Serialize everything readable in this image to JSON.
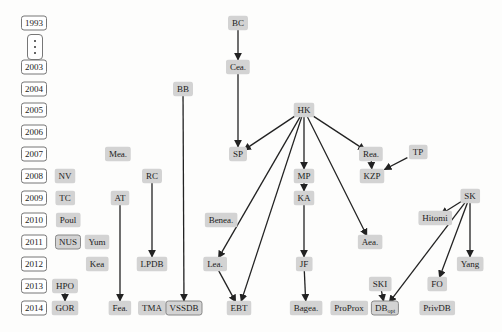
{
  "diagram": {
    "type": "timeline-dependency-graph",
    "years": [
      "1993",
      "2003",
      "2004",
      "2005",
      "2006",
      "2007",
      "2008",
      "2009",
      "2010",
      "2011",
      "2012",
      "2013",
      "2014"
    ],
    "year_gap_marker": "⋮",
    "nodes": [
      {
        "id": "BC",
        "label": "BC",
        "year": "1993",
        "x": 238,
        "y": 23
      },
      {
        "id": "Cea",
        "label": "Cea.",
        "year": "2003",
        "x": 238,
        "y": 67
      },
      {
        "id": "BB",
        "label": "BB",
        "year": "2004",
        "x": 183,
        "y": 89
      },
      {
        "id": "HK",
        "label": "HK",
        "year": "2005",
        "x": 304,
        "y": 110
      },
      {
        "id": "Mea",
        "label": "Mea.",
        "year": "2007",
        "x": 118,
        "y": 154
      },
      {
        "id": "SP",
        "label": "SP",
        "year": "2007",
        "x": 238,
        "y": 154
      },
      {
        "id": "Rea",
        "label": "Rea.",
        "year": "2007",
        "x": 371,
        "y": 154
      },
      {
        "id": "TP",
        "label": "TP",
        "year": "2007",
        "x": 418,
        "y": 152
      },
      {
        "id": "NV",
        "label": "NV",
        "year": "2008",
        "x": 65,
        "y": 176
      },
      {
        "id": "RC",
        "label": "RC",
        "year": "2008",
        "x": 152,
        "y": 176
      },
      {
        "id": "MP",
        "label": "MP",
        "year": "2008",
        "x": 304,
        "y": 176
      },
      {
        "id": "KZP",
        "label": "KZP",
        "year": "2008",
        "x": 372,
        "y": 176
      },
      {
        "id": "TC",
        "label": "TC",
        "year": "2009",
        "x": 65,
        "y": 198
      },
      {
        "id": "AT",
        "label": "AT",
        "year": "2009",
        "x": 120,
        "y": 198
      },
      {
        "id": "KA",
        "label": "KA",
        "year": "2009",
        "x": 304,
        "y": 198
      },
      {
        "id": "SK",
        "label": "SK",
        "year": "2009",
        "x": 470,
        "y": 196
      },
      {
        "id": "Poul",
        "label": "Poul",
        "year": "2010",
        "x": 68,
        "y": 220
      },
      {
        "id": "Benea",
        "label": "Benea.",
        "year": "2010",
        "x": 221,
        "y": 220
      },
      {
        "id": "Hitomi",
        "label": "Hitomi",
        "year": "2010",
        "x": 435,
        "y": 218
      },
      {
        "id": "NUS",
        "label": "NUS",
        "year": "2011",
        "x": 68,
        "y": 242,
        "bordered": true
      },
      {
        "id": "Yum",
        "label": "Yum",
        "year": "2011",
        "x": 97,
        "y": 242
      },
      {
        "id": "Aea",
        "label": "Aea.",
        "year": "2011",
        "x": 370,
        "y": 242
      },
      {
        "id": "Kea",
        "label": "Kea",
        "year": "2012",
        "x": 97,
        "y": 264
      },
      {
        "id": "LPDB",
        "label": "LPDB",
        "year": "2012",
        "x": 152,
        "y": 264
      },
      {
        "id": "Lea",
        "label": "Lea.",
        "year": "2012",
        "x": 215,
        "y": 264
      },
      {
        "id": "JF",
        "label": "JF",
        "year": "2012",
        "x": 304,
        "y": 264
      },
      {
        "id": "Yang",
        "label": "Yang",
        "year": "2012",
        "x": 470,
        "y": 264
      },
      {
        "id": "HPO",
        "label": "HPO",
        "year": "2013",
        "x": 65,
        "y": 286
      },
      {
        "id": "SKI",
        "label": "SKI",
        "year": "2013",
        "x": 380,
        "y": 284
      },
      {
        "id": "FO",
        "label": "FO",
        "year": "2013",
        "x": 437,
        "y": 284
      },
      {
        "id": "GOR",
        "label": "GOR",
        "year": "2014",
        "x": 65,
        "y": 308
      },
      {
        "id": "Fea",
        "label": "Fea.",
        "year": "2014",
        "x": 120,
        "y": 308
      },
      {
        "id": "TMA",
        "label": "TMA",
        "year": "2014",
        "x": 152,
        "y": 308
      },
      {
        "id": "VSSDB",
        "label": "VSSDB",
        "year": "2014",
        "x": 184,
        "y": 308,
        "bordered": true
      },
      {
        "id": "EBT",
        "label": "EBT",
        "year": "2014",
        "x": 239,
        "y": 308
      },
      {
        "id": "Bagea",
        "label": "Bagea.",
        "year": "2014",
        "x": 306,
        "y": 308
      },
      {
        "id": "ProProx",
        "label": "ProProx",
        "year": "2014",
        "x": 349,
        "y": 308
      },
      {
        "id": "DBopt",
        "label": "DB",
        "sub": "opt",
        "year": "2014",
        "x": 385,
        "y": 308,
        "bordered": true
      },
      {
        "id": "PrivDB",
        "label": "PrivDB",
        "year": "2014",
        "x": 437,
        "y": 308
      }
    ],
    "edges": [
      [
        "BC",
        "Cea"
      ],
      [
        "Cea",
        "SP"
      ],
      [
        "BB",
        "VSSDB"
      ],
      [
        "HK",
        "SP"
      ],
      [
        "HK",
        "MP"
      ],
      [
        "HK",
        "Rea"
      ],
      [
        "HK",
        "Lea"
      ],
      [
        "HK",
        "EBT"
      ],
      [
        "HK",
        "Aea"
      ],
      [
        "Rea",
        "KZP"
      ],
      [
        "TP",
        "KZP"
      ],
      [
        "MP",
        "KA"
      ],
      [
        "KA",
        "JF"
      ],
      [
        "JF",
        "Bagea"
      ],
      [
        "RC",
        "LPDB"
      ],
      [
        "AT",
        "Fea"
      ],
      [
        "Lea",
        "EBT"
      ],
      [
        "HPO",
        "GOR"
      ],
      [
        "SK",
        "Hitomi"
      ],
      [
        "SK",
        "Yang"
      ],
      [
        "SK",
        "FO"
      ],
      [
        "SK",
        "DBopt"
      ],
      [
        "SKI",
        "DBopt"
      ]
    ]
  }
}
